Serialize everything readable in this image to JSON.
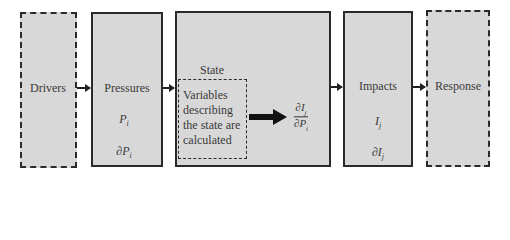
{
  "diagram": {
    "type": "DPSIR framework",
    "boxes": {
      "drivers": {
        "label": "Drivers"
      },
      "pressures": {
        "label": "Pressures",
        "var1": "P",
        "var1_sub": "i",
        "var2": "∂P",
        "var2_sub": "i"
      },
      "state": {
        "label": "State",
        "inner_text": "Variables describing the state are calculated",
        "frac_num": "∂I",
        "frac_num_sub": "j",
        "frac_den": "∂P",
        "frac_den_sub": "i"
      },
      "impacts": {
        "label": "Impacts",
        "var1": "I",
        "var1_sub": "j",
        "var2": "∂I",
        "var2_sub": "j"
      },
      "response": {
        "label": "Response"
      }
    },
    "colors": {
      "box_fill": "#d8d8d8",
      "stroke": "#2a2a2a",
      "background": "#ffffff"
    }
  }
}
